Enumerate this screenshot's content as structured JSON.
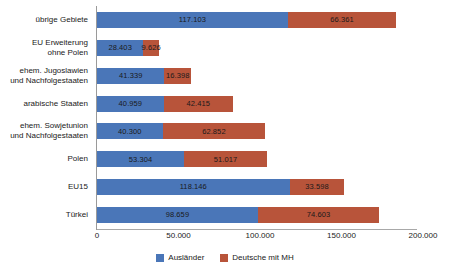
{
  "chart_data": {
    "type": "bar",
    "orientation": "horizontal",
    "stacked": true,
    "title": "",
    "subtitle": "",
    "xlabel": "",
    "ylabel": "",
    "xlim": [
      0,
      200000
    ],
    "grid": false,
    "legend_position": "bottom",
    "categories": [
      "übrige Gebiete",
      "EU Erweiterung ohne Polen",
      "ehem. Jugoslawien und Nachfolgestaaten",
      "arabische Staaten",
      "ehem. Sowjetunion und Nachfolgestaaten",
      "Polen",
      "EU15",
      "Türkei"
    ],
    "category_lines": [
      [
        "übrige Gebiete"
      ],
      [
        "EU Erweiterung",
        "ohne Polen"
      ],
      [
        "ehem. Jugoslawien",
        "und Nachfolgestaaten"
      ],
      [
        "arabische Staaten"
      ],
      [
        "ehem. Sowjetunion",
        "und Nachfolgestaaten"
      ],
      [
        "Polen"
      ],
      [
        "EU15"
      ],
      [
        "Türkei"
      ]
    ],
    "series": [
      {
        "name": "Ausländer",
        "color": "#4a76b8",
        "values": [
          117103,
          28403,
          41339,
          40959,
          40300,
          53304,
          118146,
          98659
        ],
        "labels": [
          "117.103",
          "28.403",
          "41.339",
          "40.959",
          "40.300",
          "53.304",
          "118.146",
          "98.659"
        ]
      },
      {
        "name": "Deutsche mit MH",
        "color": "#b8543a",
        "values": [
          66361,
          9626,
          16398,
          42415,
          62852,
          51017,
          33598,
          74603
        ],
        "labels": [
          "66.361",
          "9.626",
          "16.398",
          "42.415",
          "62.852",
          "51.017",
          "33.598",
          "74.603"
        ]
      }
    ],
    "xticks": [
      0,
      50000,
      100000,
      150000,
      200000
    ],
    "xtick_labels": [
      "0",
      "50.000",
      "100.000",
      "150.000",
      "200.000"
    ]
  },
  "legend": {
    "items": [
      {
        "label": "Ausländer",
        "color": "#4a76b8"
      },
      {
        "label": "Deutsche mit MH",
        "color": "#b8543a"
      }
    ]
  }
}
